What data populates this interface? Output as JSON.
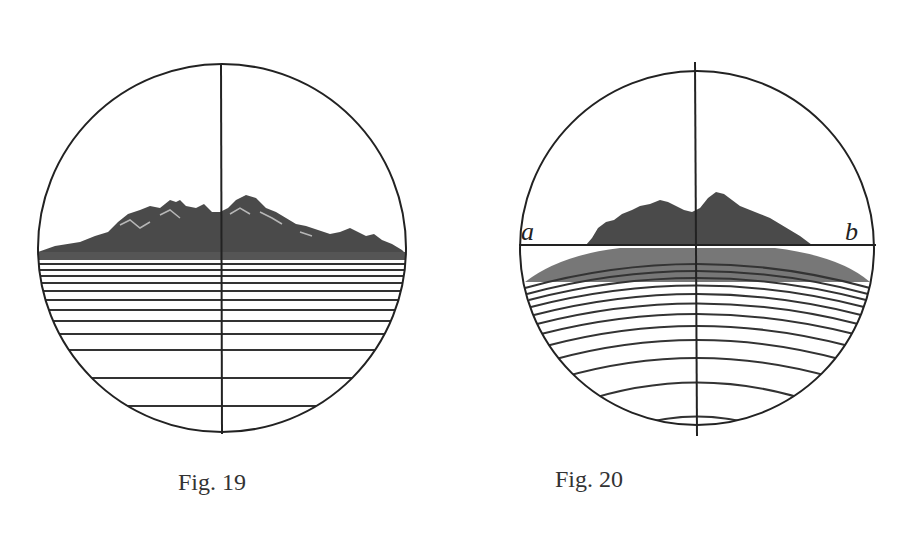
{
  "figures": [
    {
      "id": "fig19",
      "caption": "Fig. 19",
      "description": "Telescope view: flat horizon with mountains, straight horizontal sea lines, vertical crosshair"
    },
    {
      "id": "fig20",
      "caption": "Fig. 20",
      "description": "Telescope view: horizon line a–b with mountains, curved sea lines, vertical crosshair",
      "labels": {
        "left": "a",
        "right": "b"
      }
    }
  ],
  "colors": {
    "ink": "#222222",
    "background": "#ffffff"
  }
}
